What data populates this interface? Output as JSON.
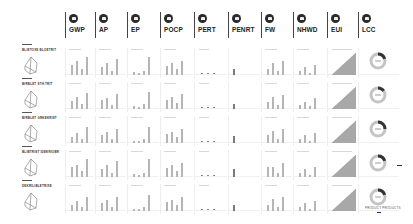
{
  "header": {
    "columns": [
      {
        "key": "gwp",
        "label": "GWP",
        "icon": "globe-icon"
      },
      {
        "key": "ap",
        "label": "AP",
        "icon": "cloud-icon"
      },
      {
        "key": "ep",
        "label": "EP",
        "icon": "water-icon"
      },
      {
        "key": "pocp",
        "label": "POCP",
        "icon": "smog-icon"
      },
      {
        "key": "pert",
        "label": "PERT",
        "icon": "leaf-icon"
      },
      {
        "key": "penrt",
        "label": "PENRT",
        "icon": "fuel-icon"
      },
      {
        "key": "fw",
        "label": "FW",
        "icon": "droplet-icon"
      },
      {
        "key": "nhwd",
        "label": "NHWD",
        "icon": "bin-icon"
      },
      {
        "key": "eui",
        "label": "EUI",
        "icon": "bolt-icon"
      },
      {
        "key": "lcc",
        "label": "LCC",
        "icon": "coin-icon"
      }
    ]
  },
  "rows": [
    {
      "label": "BLIETOXE BLOETRIT"
    },
    {
      "label": "BIRBLET STH.TRIT"
    },
    {
      "label": "BIRBLET GRKEKRIST"
    },
    {
      "label": "BLIBTRIST IDEKRIOBR"
    },
    {
      "label": "DEKRILIBLETRIXE"
    }
  ],
  "footer": {
    "note": "PRODUCT PRODUCTS"
  },
  "chart_data": {
    "type": "bar",
    "categories": [
      "GWP",
      "AP",
      "EP",
      "POCP",
      "PERT",
      "PENRT",
      "FW",
      "NHWD",
      "EUI",
      "LCC"
    ],
    "series": [
      {
        "name": "Variant 1",
        "bars": {
          "GWP": [
            10,
            14,
            6,
            18
          ],
          "AP": [
            8,
            12,
            4,
            16
          ],
          "EP": [
            3,
            2,
            4,
            18
          ],
          "POCP": [
            9,
            12,
            6,
            14
          ],
          "PERT": [
            1,
            1,
            1,
            1
          ],
          "PENRT": [
            6,
            0,
            0,
            0
          ],
          "FW": [
            6,
            12,
            4,
            14
          ],
          "NHWD": [
            4,
            8,
            2,
            10
          ],
          "EUI": [
            2,
            1,
            1,
            2
          ],
          "LCC_share": 0.2
        }
      },
      {
        "name": "Variant 2",
        "bars": {
          "GWP": [
            8,
            12,
            5,
            16
          ],
          "AP": [
            9,
            11,
            4,
            15
          ],
          "EP": [
            3,
            2,
            5,
            17
          ],
          "POCP": [
            9,
            12,
            6,
            15
          ],
          "PERT": [
            1,
            1,
            1,
            1
          ],
          "PENRT": [
            5,
            0,
            0,
            0
          ],
          "FW": [
            7,
            12,
            4,
            14
          ],
          "NHWD": [
            4,
            7,
            3,
            11
          ],
          "EUI": [
            2,
            2,
            1,
            3
          ],
          "LCC_share": 0.15
        }
      },
      {
        "name": "Variant 3",
        "bars": {
          "GWP": [
            6,
            10,
            4,
            16
          ],
          "AP": [
            8,
            11,
            4,
            14
          ],
          "EP": [
            2,
            2,
            4,
            16
          ],
          "POCP": [
            9,
            11,
            6,
            14
          ],
          "PERT": [
            1,
            1,
            1,
            1
          ],
          "PENRT": [
            7,
            0,
            0,
            0
          ],
          "FW": [
            8,
            12,
            4,
            14
          ],
          "NHWD": [
            4,
            8,
            2,
            10
          ],
          "EUI": [
            2,
            1,
            1,
            2
          ],
          "LCC_share": 0.25
        }
      },
      {
        "name": "Variant 4",
        "bars": {
          "GWP": [
            10,
            12,
            6,
            18
          ],
          "AP": [
            8,
            12,
            4,
            16
          ],
          "EP": [
            3,
            2,
            4,
            18
          ],
          "POCP": [
            9,
            12,
            6,
            14
          ],
          "PERT": [
            1,
            1,
            1,
            1
          ],
          "PENRT": [
            8,
            0,
            0,
            0
          ],
          "FW": [
            10,
            10,
            4,
            14
          ],
          "NHWD": [
            4,
            8,
            2,
            10
          ],
          "EUI": [
            2,
            1,
            1,
            2
          ],
          "LCC_share": 0.2
        }
      },
      {
        "name": "Variant 5",
        "bars": {
          "GWP": [
            6,
            10,
            4,
            14
          ],
          "AP": [
            8,
            11,
            4,
            14
          ],
          "EP": [
            2,
            2,
            4,
            16
          ],
          "POCP": [
            9,
            11,
            6,
            14
          ],
          "PERT": [
            1,
            1,
            1,
            1
          ],
          "PENRT": [
            6,
            0,
            0,
            0
          ],
          "FW": [
            6,
            12,
            4,
            14
          ],
          "NHWD": [
            4,
            8,
            2,
            10
          ],
          "EUI": [
            2,
            1,
            1,
            2
          ],
          "LCC_share": 0.2
        }
      }
    ],
    "grid": false,
    "legend": "none"
  }
}
